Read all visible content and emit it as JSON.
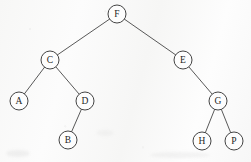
{
  "diagram": {
    "type": "tree",
    "canvas": {
      "width": 251,
      "height": 162
    },
    "style": {
      "background_color": "#fbfbfb",
      "node_fill": "#fdfdfd",
      "node_stroke": "#2f2f2f",
      "edge_stroke": "#3b3b3b",
      "label_color": "#1d1d1d",
      "node_radius": 9
    },
    "nodes": [
      {
        "id": "F",
        "label": "F",
        "x": 117,
        "y": 14,
        "r": 9,
        "level": 0
      },
      {
        "id": "C",
        "label": "C",
        "x": 50,
        "y": 60,
        "r": 9,
        "level": 1
      },
      {
        "id": "E",
        "label": "E",
        "x": 183,
        "y": 60,
        "r": 9,
        "level": 1
      },
      {
        "id": "A",
        "label": "A",
        "x": 19,
        "y": 101,
        "r": 9,
        "level": 2
      },
      {
        "id": "D",
        "label": "D",
        "x": 85,
        "y": 101,
        "r": 9,
        "level": 2
      },
      {
        "id": "G",
        "label": "G",
        "x": 218,
        "y": 101,
        "r": 9,
        "level": 2
      },
      {
        "id": "B",
        "label": "B",
        "x": 68,
        "y": 140,
        "r": 9,
        "level": 3
      },
      {
        "id": "H",
        "label": "H",
        "x": 202,
        "y": 141,
        "r": 9,
        "level": 3
      },
      {
        "id": "P",
        "label": "P",
        "x": 234,
        "y": 141,
        "r": 9,
        "level": 3
      }
    ],
    "edges": [
      {
        "id": "F-C",
        "from": "F",
        "to": "C",
        "side": "left"
      },
      {
        "id": "F-E",
        "from": "F",
        "to": "E",
        "side": "right"
      },
      {
        "id": "C-A",
        "from": "C",
        "to": "A",
        "side": "left"
      },
      {
        "id": "C-D",
        "from": "C",
        "to": "D",
        "side": "right"
      },
      {
        "id": "D-B",
        "from": "D",
        "to": "B",
        "side": "left"
      },
      {
        "id": "E-G",
        "from": "E",
        "to": "G",
        "side": "right"
      },
      {
        "id": "G-H",
        "from": "G",
        "to": "H",
        "side": "left"
      },
      {
        "id": "G-P",
        "from": "G",
        "to": "P",
        "side": "right"
      }
    ]
  }
}
